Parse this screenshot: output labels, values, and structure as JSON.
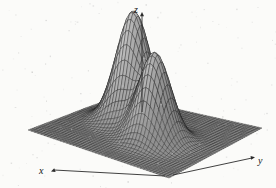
{
  "figure": {
    "title": "",
    "caption": "",
    "background_color": "#fbfbf9",
    "mesh_color": "#1d1d1d",
    "surface_fill_dark": "#4a4a4a",
    "surface_fill_light": "#b9b9b9",
    "axis_color": "#2b2b2b"
  },
  "axes": {
    "x": {
      "label": "x",
      "arrow": "down-left"
    },
    "y": {
      "label": "y",
      "arrow": "right"
    },
    "z": {
      "label": "z",
      "arrow": "up"
    }
  },
  "chart_data": {
    "type": "surface",
    "title": "",
    "xlabel": "x",
    "ylabel": "y",
    "zlabel": "z",
    "grid": true,
    "legend": false,
    "projection": "3d-wireframe-surface",
    "xlim": [
      -4,
      4
    ],
    "ylim": [
      -4,
      4
    ],
    "zlim": [
      0,
      1
    ],
    "grid_n": 44,
    "peaks": [
      {
        "name": "peak-left-tall",
        "cx": -1.15,
        "cy": -0.85,
        "amplitude": 1.0,
        "sigma": 0.82
      },
      {
        "name": "peak-right-short",
        "cx": 0.95,
        "cy": 0.55,
        "amplitude": 0.78,
        "sigma": 0.78
      }
    ],
    "function": "z = 1.00*exp(-((x+1.15)^2+(y+0.85)^2)/(2*0.82^2)) + 0.78*exp(-((x-0.95)^2+(y-0.55)^2)/(2*0.78^2))",
    "screen_anchors": {
      "base_left_corner": [
        28,
        130
      ],
      "base_right_corner": [
        262,
        128
      ],
      "base_front_corner": [
        169,
        178
      ],
      "base_back_corner": [
        118,
        96
      ],
      "peak_left_apex": [
        115,
        18
      ],
      "peak_right_apex": [
        163,
        36
      ],
      "z_axis_top": [
        142,
        12
      ],
      "z_axis_bottom": [
        142,
        112
      ]
    }
  }
}
